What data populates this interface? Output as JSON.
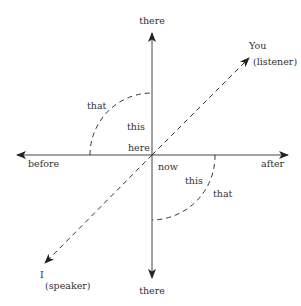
{
  "diagram": {
    "type": "deixis-axes",
    "colors": {
      "line": "#444444",
      "text": "#333333",
      "background": "#ffffff"
    },
    "axes": {
      "vertical_top_label": "there",
      "vertical_bottom_label": "there",
      "horizontal_left_label": "before",
      "horizontal_right_label": "after"
    },
    "diagonal": {
      "top_label_line1": "You",
      "top_label_line2": "(listener)",
      "bottom_label_line1": "I",
      "bottom_label_line2": "(speaker)"
    },
    "center": {
      "space_label": "here",
      "time_label": "now"
    },
    "upper_left_region": {
      "near_label": "this",
      "far_label": "that"
    },
    "lower_right_region": {
      "near_label": "this",
      "far_label": "that"
    }
  }
}
